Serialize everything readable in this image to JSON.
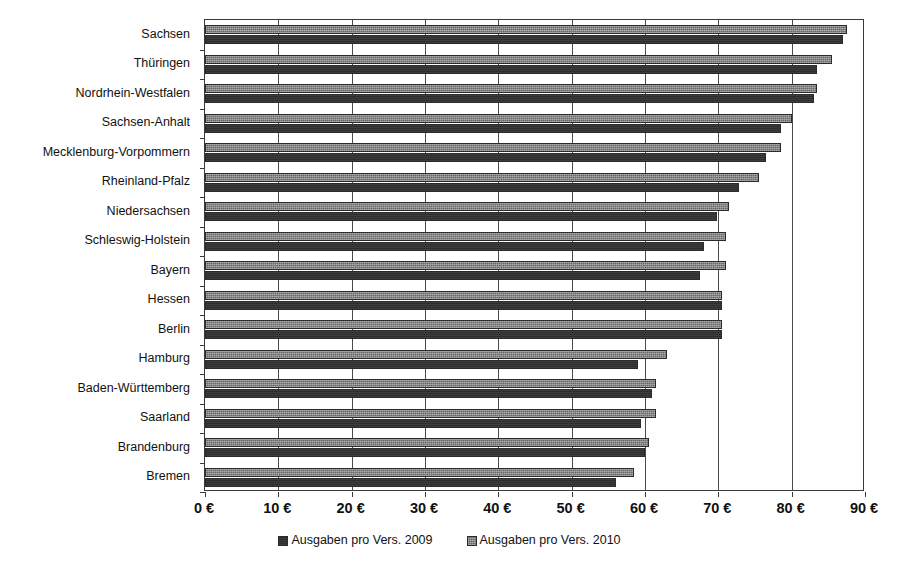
{
  "chart_data": {
    "type": "bar",
    "orientation": "horizontal",
    "title": "",
    "xlabel": "",
    "ylabel": "",
    "xlim": [
      0,
      90
    ],
    "xticks": [
      0,
      10,
      20,
      30,
      40,
      50,
      60,
      70,
      80,
      90
    ],
    "xtick_labels": [
      "0 €",
      "10 €",
      "20 €",
      "30 €",
      "40 €",
      "50 €",
      "60 €",
      "70 €",
      "80 €",
      "90 €"
    ],
    "grid": true,
    "grid_axis": "x",
    "legend_position": "bottom",
    "categories": [
      "Sachsen",
      "Thüringen",
      "Nordrhein-Westfalen",
      "Sachsen-Anhalt",
      "Mecklenburg-Vorpommern",
      "Rheinland-Pfalz",
      "Niedersachsen",
      "Schleswig-Holstein",
      "Bayern",
      "Hessen",
      "Berlin",
      "Hamburg",
      "Baden-Württemberg",
      "Saarland",
      "Brandenburg",
      "Bremen"
    ],
    "series": [
      {
        "name": "Ausgaben pro Vers. 2009",
        "color": "#2e2e2e",
        "values": [
          87.0,
          83.5,
          83.0,
          78.5,
          76.5,
          72.8,
          69.8,
          68.0,
          67.5,
          70.5,
          70.5,
          59.0,
          61.0,
          59.5,
          60.0,
          56.0
        ]
      },
      {
        "name": "Ausgaben pro Vers. 2010",
        "color": "#7e7e7e",
        "values": [
          87.5,
          85.5,
          83.5,
          80.0,
          78.5,
          75.5,
          71.5,
          71.0,
          71.0,
          70.5,
          70.5,
          63.0,
          61.5,
          61.5,
          60.5,
          58.5
        ]
      }
    ]
  },
  "legend": {
    "items": [
      {
        "label": "Ausgaben pro Vers. 2009",
        "color": "#2e2e2e"
      },
      {
        "label": "Ausgaben pro Vers. 2010",
        "color": "#7e7e7e"
      }
    ]
  }
}
